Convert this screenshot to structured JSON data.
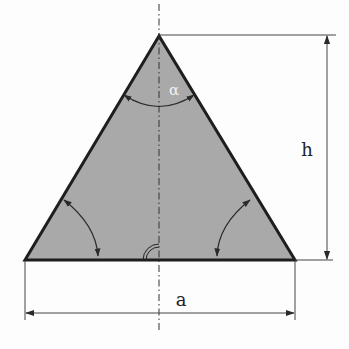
{
  "diagram": {
    "labels": {
      "angle": "α",
      "height": "h",
      "base": "a"
    },
    "colors": {
      "fill": "#a9a9a9",
      "stroke": "#1e1e1e",
      "dim_line": "#444444"
    },
    "geometry": {
      "apex": [
        159,
        36
      ],
      "base_left": [
        25,
        260
      ],
      "base_right": [
        295,
        260
      ]
    }
  }
}
